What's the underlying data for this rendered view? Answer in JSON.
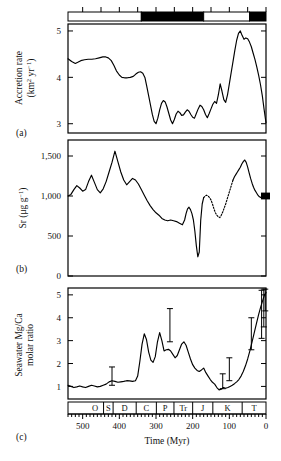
{
  "figure": {
    "title": "",
    "xlabel": "Time (Myr)",
    "panel_tags": {
      "a": "(a)",
      "b": "(b)",
      "c": "(c)"
    }
  },
  "chart_data": [
    {
      "type": "line",
      "panel": "a",
      "title": "",
      "xlabel": "Time (Myr)",
      "ylabel": "Accretion rate (km2 yr-1)",
      "ylabel_parts": {
        "line1": "Accretion rate",
        "line2_pre": "(km",
        "line2_sup1": "2",
        "line2_mid": " yr",
        "line2_sup2": "−1",
        "line2_post": ")"
      },
      "xlim": [
        540,
        0
      ],
      "ylim": [
        2.8,
        5.15
      ],
      "yticks": [
        3,
        4,
        5
      ],
      "ytick_labels": [
        "3",
        "4",
        "5"
      ],
      "xticks": [
        500,
        400,
        300,
        200,
        100,
        0
      ],
      "grid": false,
      "x": [
        540,
        530,
        520,
        512,
        505,
        495,
        485,
        475,
        465,
        455,
        445,
        437,
        430,
        422,
        415,
        408,
        400,
        393,
        386,
        378,
        370,
        362,
        355,
        348,
        342,
        336,
        330,
        325,
        320,
        315,
        310,
        305,
        300,
        295,
        290,
        285,
        280,
        275,
        270,
        265,
        260,
        255,
        250,
        245,
        240,
        235,
        230,
        225,
        220,
        215,
        210,
        205,
        200,
        195,
        190,
        185,
        180,
        175,
        170,
        165,
        160,
        155,
        150,
        145,
        140,
        135,
        130,
        125,
        120,
        115,
        110,
        105,
        100,
        95,
        90,
        85,
        80,
        75,
        70,
        65,
        60,
        55,
        50,
        45,
        40,
        35,
        30,
        25,
        20,
        15,
        10,
        5,
        0
      ],
      "y": [
        4.4,
        4.34,
        4.3,
        4.33,
        4.36,
        4.38,
        4.39,
        4.39,
        4.4,
        4.42,
        4.44,
        4.44,
        4.42,
        4.36,
        4.26,
        4.14,
        4.05,
        4.0,
        3.99,
        3.99,
        4.0,
        4.02,
        4.07,
        4.11,
        4.12,
        4.09,
        3.99,
        3.8,
        3.6,
        3.4,
        3.2,
        3.05,
        3.0,
        3.12,
        3.3,
        3.44,
        3.5,
        3.47,
        3.36,
        3.22,
        3.08,
        3.0,
        3.09,
        3.21,
        3.27,
        3.24,
        3.18,
        3.19,
        3.25,
        3.3,
        3.27,
        3.2,
        3.14,
        3.12,
        3.22,
        3.32,
        3.4,
        3.37,
        3.3,
        3.2,
        3.13,
        3.22,
        3.32,
        3.42,
        3.48,
        3.44,
        3.62,
        3.86,
        3.7,
        3.52,
        3.46,
        3.62,
        3.86,
        4.1,
        4.34,
        4.58,
        4.8,
        4.95,
        5.0,
        4.9,
        4.82,
        4.85,
        4.83,
        4.76,
        4.66,
        4.52,
        4.38,
        4.22,
        4.04,
        3.84,
        3.6,
        3.3,
        3.02
      ],
      "polarity_bar": {
        "description": "magnetic polarity / superchron bar above panel a",
        "segments": [
          {
            "from": 540,
            "to": 340,
            "fill": "white"
          },
          {
            "from": 340,
            "to": 170,
            "fill": "black"
          },
          {
            "from": 170,
            "to": 45,
            "fill": "white"
          },
          {
            "from": 45,
            "to": 0,
            "fill": "black"
          }
        ],
        "ticks": [
          500,
          450,
          400,
          350,
          300,
          250,
          200,
          150,
          100,
          50,
          0
        ]
      }
    },
    {
      "type": "line",
      "panel": "b",
      "title": "",
      "xlabel": "Time (Myr)",
      "ylabel": "Sr (ug g-1)",
      "ylabel_parts": {
        "pre": "Sr (μg g",
        "sup": "−1",
        "post": ")"
      },
      "xlim": [
        540,
        0
      ],
      "ylim": [
        0,
        1700
      ],
      "yticks": [
        0,
        500,
        1000,
        1500
      ],
      "ytick_labels": [
        "0",
        "500",
        "1,000",
        "1,500"
      ],
      "xticks": [
        500,
        400,
        300,
        200,
        100,
        0
      ],
      "grid": false,
      "x": [
        540,
        532,
        524,
        516,
        508,
        500,
        492,
        484,
        476,
        468,
        460,
        452,
        444,
        436,
        428,
        420,
        412,
        404,
        396,
        388,
        380,
        372,
        364,
        356,
        348,
        340,
        332,
        324,
        316,
        308,
        300,
        292,
        284,
        276,
        268,
        260,
        252,
        244,
        236,
        228,
        222,
        218,
        214,
        210,
        206,
        202,
        198,
        194,
        190,
        186,
        182,
        178,
        174,
        170
      ],
      "y": [
        1000,
        1020,
        1080,
        1130,
        1100,
        1060,
        1080,
        1180,
        1260,
        1170,
        1080,
        1040,
        1090,
        1180,
        1300,
        1420,
        1560,
        1430,
        1300,
        1200,
        1140,
        1180,
        1220,
        1200,
        1150,
        1080,
        1010,
        940,
        880,
        830,
        790,
        760,
        720,
        700,
        690,
        700,
        690,
        680,
        660,
        640,
        700,
        780,
        840,
        860,
        830,
        780,
        700,
        560,
        380,
        240,
        300,
        700,
        900,
        980
      ],
      "x_dotted": [
        170,
        166,
        162,
        158,
        154,
        150,
        146,
        142,
        138,
        134,
        130,
        126,
        122,
        118,
        114,
        110,
        106,
        102,
        98,
        94,
        90
      ],
      "y_dotted": [
        980,
        1000,
        1010,
        1000,
        980,
        950,
        900,
        840,
        790,
        760,
        740,
        730,
        760,
        800,
        850,
        900,
        960,
        1020,
        1080,
        1140,
        1200
      ],
      "x2": [
        90,
        86,
        82,
        78,
        74,
        70,
        66,
        62,
        58,
        54,
        50,
        46,
        42,
        38,
        34,
        30,
        26,
        22,
        18,
        14,
        10,
        6,
        2,
        0
      ],
      "y2": [
        1200,
        1240,
        1270,
        1300,
        1330,
        1360,
        1400,
        1430,
        1450,
        1420,
        1360,
        1290,
        1220,
        1160,
        1110,
        1070,
        1040,
        1010,
        990,
        980,
        1000,
        1020,
        1030,
        1030
      ],
      "end_marker": {
        "x": 0,
        "y": 1000,
        "shape": "filled-square",
        "color": "#000000"
      }
    },
    {
      "type": "line",
      "panel": "c",
      "title": "",
      "xlabel": "Time (Myr)",
      "ylabel": "Seawater Mg/Ca molar ratio",
      "ylabel_parts": {
        "line1": "Seawater Mg/Ca",
        "line2": "molar ratio"
      },
      "xlim": [
        540,
        0
      ],
      "ylim": [
        0.45,
        5.3
      ],
      "yticks": [
        1,
        2,
        3,
        4,
        5
      ],
      "ytick_labels": [
        "1",
        "2",
        "3",
        "4",
        "5"
      ],
      "xticks": [
        500,
        400,
        300,
        200,
        100,
        0
      ],
      "grid": false,
      "x": [
        540,
        532,
        524,
        516,
        508,
        500,
        492,
        484,
        476,
        468,
        460,
        452,
        444,
        436,
        428,
        420,
        412,
        404,
        396,
        388,
        380,
        372,
        364,
        356,
        350,
        344,
        338,
        332,
        326,
        320,
        314,
        308,
        302,
        296,
        290,
        284,
        278,
        272,
        266,
        260,
        254,
        248,
        242,
        236,
        230,
        224,
        218,
        212,
        206,
        200,
        194,
        188,
        182,
        176,
        170,
        164,
        158,
        152,
        146,
        140,
        134,
        128,
        122,
        116,
        110,
        104,
        98,
        92,
        86,
        80,
        74,
        68,
        62,
        56,
        50,
        44,
        38,
        32,
        26,
        20,
        14,
        8,
        4,
        0
      ],
      "y": [
        1.05,
        1.0,
        0.95,
        0.98,
        1.02,
        0.98,
        0.95,
        1.0,
        1.05,
        1.02,
        0.98,
        1.0,
        1.05,
        1.1,
        1.2,
        1.25,
        1.22,
        1.18,
        1.2,
        1.22,
        1.25,
        1.24,
        1.22,
        1.25,
        1.45,
        2.1,
        2.85,
        3.3,
        3.05,
        2.5,
        2.15,
        2.05,
        2.3,
        2.95,
        3.35,
        3.0,
        2.55,
        2.6,
        2.62,
        2.55,
        2.4,
        2.25,
        2.35,
        2.6,
        2.85,
        2.95,
        2.8,
        2.5,
        2.2,
        1.95,
        1.8,
        1.7,
        1.65,
        1.72,
        1.8,
        1.6,
        1.45,
        1.3,
        1.18,
        1.1,
        0.95,
        0.85,
        0.88,
        0.95,
        0.92,
        0.95,
        1.0,
        1.05,
        1.12,
        1.2,
        1.3,
        1.45,
        1.65,
        1.9,
        2.2,
        2.55,
        2.95,
        3.35,
        3.75,
        4.15,
        4.5,
        4.8,
        5.0,
        5.1
      ],
      "error_bars": [
        {
          "x": 420,
          "low": 1.05,
          "high": 1.85,
          "center": 1.45
        },
        {
          "x": 262,
          "low": 2.95,
          "high": 4.4,
          "center": 3.7
        },
        {
          "x": 118,
          "low": 0.9,
          "high": 1.55,
          "center": 1.2
        },
        {
          "x": 100,
          "low": 1.25,
          "high": 2.25,
          "center": 1.75
        },
        {
          "x": 40,
          "low": 2.6,
          "high": 4.0,
          "center": 3.3
        },
        {
          "x": 12,
          "low": 3.1,
          "high": 5.2,
          "center": 4.1
        },
        {
          "x": 6,
          "low": 3.6,
          "high": 5.25,
          "center": 4.4
        },
        {
          "x": 2,
          "low": 4.3,
          "high": 5.25,
          "center": 4.8
        }
      ],
      "period_bar": {
        "description": "geologic period abbreviations below panel c",
        "periods": [
          {
            "label": "O",
            "from": 490,
            "to": 443
          },
          {
            "label": "S",
            "from": 443,
            "to": 417
          },
          {
            "label": "D",
            "from": 417,
            "to": 354
          },
          {
            "label": "C",
            "from": 354,
            "to": 299
          },
          {
            "label": "P",
            "from": 299,
            "to": 251
          },
          {
            "label": "Tr",
            "from": 251,
            "to": 200
          },
          {
            "label": "J",
            "from": 200,
            "to": 145
          },
          {
            "label": "K",
            "from": 145,
            "to": 65
          },
          {
            "label": "T",
            "from": 65,
            "to": 0
          }
        ]
      }
    }
  ],
  "colors": {
    "line": "#000000",
    "axis": "#000000",
    "background": "#ffffff",
    "bar_fill": "#000000",
    "bar_empty": "#ffffff"
  }
}
